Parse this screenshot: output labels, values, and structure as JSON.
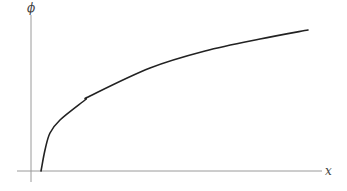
{
  "chart_data": {
    "type": "line",
    "title": "",
    "xlabel": "x",
    "ylabel": "ϕ",
    "grid": false,
    "legend": null,
    "series": [
      {
        "name": "phi(x)",
        "pixel_points": [
          [
            41,
            171
          ],
          [
            45,
            150
          ],
          [
            50,
            133
          ],
          [
            60,
            120
          ],
          [
            85,
            100
          ],
          [
            90,
            96
          ],
          [
            150,
            68
          ],
          [
            205,
            51
          ],
          [
            260,
            39
          ],
          [
            308,
            30
          ]
        ]
      }
    ],
    "axes": {
      "origin_px": [
        31,
        171
      ],
      "x_axis": {
        "from_px": 17,
        "to_px": 322,
        "y_px": 171
      },
      "y_axis": {
        "from_px": 15,
        "to_px": 182,
        "x_px": 31
      }
    },
    "colors": {
      "axis": "#999999",
      "curve": "#222222",
      "label": "#444444"
    }
  },
  "labels": {
    "x_axis": "x",
    "y_axis": "ϕ"
  }
}
